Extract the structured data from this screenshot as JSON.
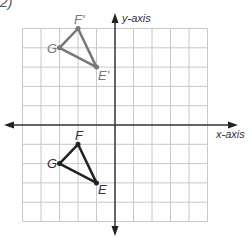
{
  "corner_label": "2)",
  "axes": {
    "x_label": "x-axis",
    "y_label": "y-axis"
  },
  "grid": {
    "x_min": -5,
    "x_max": 5,
    "y_min": -5,
    "y_max": 5,
    "line_color": "#c8c8c8",
    "axis_color": "#333333"
  },
  "triangles": {
    "image": {
      "color": "#777777",
      "vertices": [
        {
          "name": "F'",
          "x": -2,
          "y": 5
        },
        {
          "name": "G",
          "x": -3,
          "y": 4
        },
        {
          "name": "E'",
          "x": -1,
          "y": 3
        }
      ]
    },
    "original": {
      "color": "#222222",
      "vertices": [
        {
          "name": "F",
          "x": -2,
          "y": -1
        },
        {
          "name": "G",
          "x": -3,
          "y": -2
        },
        {
          "name": "E",
          "x": -1,
          "y": -3
        }
      ]
    }
  },
  "labels": {
    "F_prime": "F'",
    "G_prime": "G",
    "E_prime": "E'",
    "F": "F",
    "G": "G",
    "E": "E"
  }
}
